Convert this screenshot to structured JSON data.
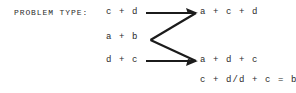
{
  "canvas": {
    "width": 296,
    "height": 93,
    "background": "#ffffff",
    "ink": "#2b2b2b"
  },
  "header": {
    "label": "PROBLEM TYPE:"
  },
  "diagram": {
    "left_terms": [
      {
        "text": "c + d"
      },
      {
        "text": "a + b"
      },
      {
        "text": "d + c"
      }
    ],
    "right_terms": [
      {
        "text": "a + c + d"
      },
      {
        "text": "a + d + c"
      }
    ],
    "equation": "c + d/d + c = b",
    "connector": {
      "shape": "z-bracket",
      "stroke_color": "#1b1b1b",
      "arrowheads": 2,
      "arrow_direction": "right",
      "segments": [
        {
          "name": "top-horizontal",
          "x1": 146,
          "y1": 13,
          "x2": 196,
          "y2": 13
        },
        {
          "name": "upper-diagonal",
          "x1": 150,
          "y1": 40,
          "x2": 196,
          "y2": 13
        },
        {
          "name": "lower-diagonal",
          "x1": 150,
          "y1": 40,
          "x2": 196,
          "y2": 61
        },
        {
          "name": "bottom-horizontal",
          "x1": 146,
          "y1": 61,
          "x2": 196,
          "y2": 61
        }
      ]
    }
  }
}
